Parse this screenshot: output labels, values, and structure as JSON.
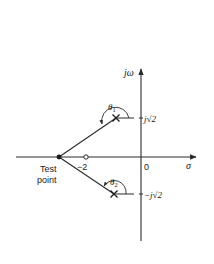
{
  "diagram": {
    "type": "s-plane pole-zero plot",
    "axes": {
      "vertical_label": "jω",
      "horizontal_label": "σ",
      "origin_label": "0"
    },
    "test_point": {
      "label_line1": "Test",
      "label_line2": "point"
    },
    "zero": {
      "label": "−2"
    },
    "poles": [
      {
        "marker": "×",
        "label": "j√2",
        "angle_label": "θ",
        "angle_sub": "1"
      },
      {
        "marker": "×",
        "label": "−j√2",
        "angle_label": "θ",
        "angle_sub": "2"
      }
    ],
    "colors": {
      "line": "#2a2a2a",
      "background": "#ffffff"
    }
  }
}
